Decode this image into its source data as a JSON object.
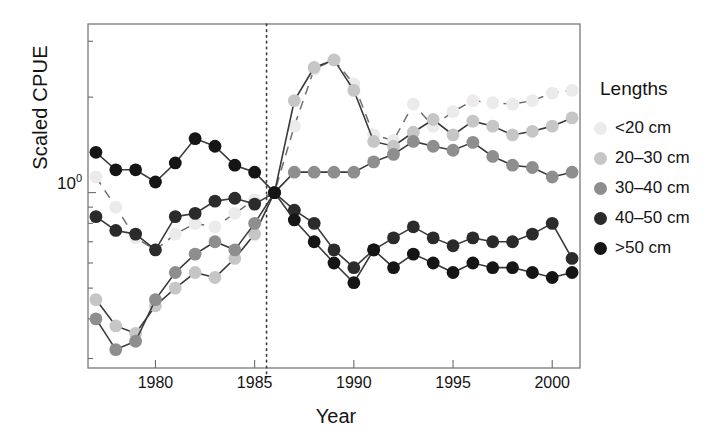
{
  "chart_data": {
    "type": "line",
    "title": "",
    "xlabel": "Year",
    "ylabel": "Scaled CPUE",
    "y_scale": "log",
    "ylim": [
      0.28,
      3.4
    ],
    "xlim": [
      1976.6,
      2001.4
    ],
    "grid": false,
    "y_ticks_labeled": [
      "10⁰"
    ],
    "y_tick_values": [
      1.0
    ],
    "x_ticks": [
      "1980",
      "1985",
      "1990",
      "1995",
      "2000"
    ],
    "x_tick_values": [
      1980,
      1985,
      1990,
      1995,
      2000
    ],
    "reference_line": {
      "x": 1985.6,
      "style": "dotted",
      "color": "#3a3a3a"
    },
    "legend": {
      "title": "Lengths",
      "position": "right",
      "entries": [
        "<20 cm",
        "20–30 cm",
        "30–40 cm",
        "40–50 cm",
        ">50 cm"
      ]
    },
    "x": [
      1977,
      1978,
      1979,
      1980,
      1981,
      1982,
      1983,
      1984,
      1985,
      1986,
      1987,
      1988,
      1989,
      1990,
      1991,
      1992,
      1993,
      1994,
      1995,
      1996,
      1997,
      1998,
      1999,
      2000,
      2001
    ],
    "series": [
      {
        "name": "<20 cm",
        "color": "#eceaea",
        "line_style": "dashed",
        "values": [
          1.12,
          0.9,
          0.72,
          0.66,
          0.74,
          0.8,
          0.78,
          0.86,
          0.95,
          1.0,
          1.62,
          2.45,
          2.62,
          2.2,
          1.52,
          1.46,
          1.9,
          1.62,
          1.8,
          1.95,
          1.92,
          1.9,
          1.95,
          2.06,
          2.1
        ]
      },
      {
        "name": "20–30 cm",
        "color": "#c6c6c6",
        "line_style": "solid",
        "values": [
          0.46,
          0.38,
          0.36,
          0.44,
          0.5,
          0.56,
          0.54,
          0.62,
          0.74,
          1.0,
          1.95,
          2.48,
          2.62,
          2.1,
          1.45,
          1.4,
          1.55,
          1.7,
          1.52,
          1.68,
          1.62,
          1.52,
          1.56,
          1.62,
          1.72
        ]
      },
      {
        "name": "30–40 cm",
        "color": "#8e8e8e",
        "line_style": "solid",
        "values": [
          0.4,
          0.32,
          0.34,
          0.46,
          0.56,
          0.64,
          0.7,
          0.66,
          0.8,
          1.0,
          1.16,
          1.16,
          1.16,
          1.16,
          1.25,
          1.32,
          1.45,
          1.4,
          1.36,
          1.44,
          1.3,
          1.22,
          1.2,
          1.12,
          1.16
        ]
      },
      {
        "name": "40–50 cm",
        "color": "#2b2b2b",
        "line_style": "solid",
        "values": [
          0.84,
          0.76,
          0.74,
          0.66,
          0.84,
          0.86,
          0.94,
          0.96,
          0.92,
          1.0,
          0.88,
          0.8,
          0.66,
          0.58,
          0.66,
          0.72,
          0.78,
          0.72,
          0.68,
          0.72,
          0.7,
          0.7,
          0.74,
          0.8,
          0.62
        ]
      },
      {
        "name": ">50 cm",
        "color": "#151515",
        "line_style": "solid",
        "values": [
          1.34,
          1.18,
          1.18,
          1.08,
          1.24,
          1.48,
          1.4,
          1.22,
          1.16,
          1.0,
          0.82,
          0.7,
          0.6,
          0.52,
          0.66,
          0.58,
          0.64,
          0.6,
          0.56,
          0.6,
          0.58,
          0.58,
          0.56,
          0.54,
          0.56
        ]
      }
    ]
  },
  "axes": {
    "ylabel": "Scaled CPUE",
    "ytick": "10",
    "ytick_exp": "0",
    "xlabel": "Year"
  },
  "legend": {
    "title": "Lengths",
    "items": [
      {
        "label": "<20 cm",
        "color": "#eceaea"
      },
      {
        "label": "20–30 cm",
        "color": "#c6c6c6"
      },
      {
        "label": "30–40 cm",
        "color": "#8e8e8e"
      },
      {
        "label": "40–50 cm",
        "color": "#2b2b2b"
      },
      {
        "label": ">50 cm",
        "color": "#151515"
      }
    ]
  }
}
